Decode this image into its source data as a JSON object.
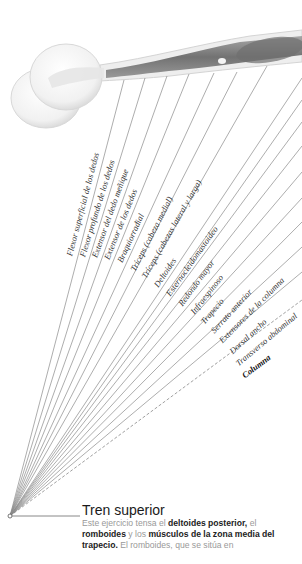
{
  "diagram": {
    "illustration": "arm-with-dumbbell",
    "origin": {
      "x": 10,
      "y": 516
    },
    "labels": [
      {
        "text": "Flexor superficial de los dedos",
        "end": [
          124,
          80
        ],
        "lx": 74,
        "ly": 257,
        "bold": false,
        "dashed": false
      },
      {
        "text": "Flexor profundo de los dedos",
        "end": [
          145,
          78
        ],
        "lx": 87,
        "ly": 258,
        "bold": false,
        "dashed": false
      },
      {
        "text": "Extensor del dedo meñique",
        "end": [
          167,
          76
        ],
        "lx": 99,
        "ly": 259,
        "bold": false,
        "dashed": false
      },
      {
        "text": "Extensor de los dedos",
        "end": [
          189,
          74
        ],
        "lx": 111,
        "ly": 261,
        "bold": false,
        "dashed": false
      },
      {
        "text": "Braquiorradial",
        "end": [
          214,
          73
        ],
        "lx": 124,
        "ly": 264,
        "bold": false,
        "dashed": false
      },
      {
        "text": "Tríceps (cabeza medial)",
        "end": [
          237,
          72
        ],
        "lx": 137,
        "ly": 273,
        "bold": false,
        "dashed": false
      },
      {
        "text": "Tríceps (cabezas lateral y larga)",
        "end": [
          267,
          66
        ],
        "lx": 148,
        "ly": 280,
        "bold": false,
        "dashed": false
      },
      {
        "text": "Deltoides",
        "end": [
          302,
          78
        ],
        "lx": 160,
        "ly": 289,
        "bold": false,
        "dashed": false
      },
      {
        "text": "Esternocleidomastoideo",
        "end": [
          302,
          100
        ],
        "lx": 172,
        "ly": 298,
        "bold": false,
        "dashed": false
      },
      {
        "text": "Redondo mayor",
        "end": [
          302,
          122
        ],
        "lx": 184,
        "ly": 308,
        "bold": false,
        "dashed": false
      },
      {
        "text": "Infraespinoso",
        "end": [
          302,
          146
        ],
        "lx": 196,
        "ly": 316,
        "bold": false,
        "dashed": false
      },
      {
        "text": "Trapecio",
        "end": [
          302,
          172
        ],
        "lx": 206,
        "ly": 326,
        "bold": false,
        "dashed": false
      },
      {
        "text": "Serrato anterior",
        "end": [
          302,
          198
        ],
        "lx": 216,
        "ly": 335,
        "bold": false,
        "dashed": false
      },
      {
        "text": "Extensores de la columna",
        "end": [
          302,
          222
        ],
        "lx": 224,
        "ly": 345,
        "bold": false,
        "dashed": false
      },
      {
        "text": "Dorsal ancho",
        "end": [
          302,
          247
        ],
        "lx": 234,
        "ly": 356,
        "bold": false,
        "dashed": false
      },
      {
        "text": "Transverso abdominal",
        "end": [
          302,
          272
        ],
        "lx": 240,
        "ly": 368,
        "bold": false,
        "dashed": false
      },
      {
        "text": "Columna",
        "end": [
          302,
          300
        ],
        "lx": 246,
        "ly": 380,
        "bold": true,
        "dashed": true
      }
    ]
  },
  "caption": {
    "title": "Tren superior",
    "body_parts": [
      {
        "text": "Este ejercicio tensa el ",
        "bold": false
      },
      {
        "text": "deltoides posterior,",
        "bold": true
      },
      {
        "text": " el ",
        "bold": false
      },
      {
        "text": "romboides",
        "bold": true
      },
      {
        "text": " y los ",
        "bold": false
      },
      {
        "text": "músculos de la zona media del trapecio.",
        "bold": true
      },
      {
        "text": " El romboides, que se sitúa en",
        "bold": false
      }
    ]
  }
}
